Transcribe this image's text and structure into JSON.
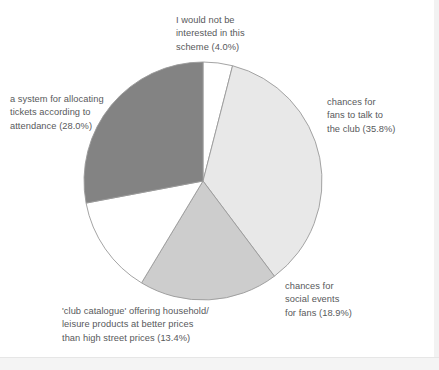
{
  "figure": {
    "background_color": "#ffffff",
    "text_color": "#58595b",
    "slice_stroke_color": "#9a9a9a"
  },
  "chart_data": {
    "type": "pie",
    "title": "",
    "subtitle": "",
    "xlabel": "",
    "ylabel": "",
    "legend_position": "none",
    "grid": false,
    "start_angle_deg": 0,
    "direction": "clockwise",
    "center": {
      "x": 203,
      "y": 181
    },
    "radius": 119,
    "units": "percent",
    "categories": [
      "I would not be interested in this scheme",
      "chances for fans to talk to the club",
      "chances for social events for fans",
      "'club catalogue' offering household/leisure products at better prices than high street prices",
      "a system for allocating tickets according to attendance"
    ],
    "values": [
      4.0,
      35.8,
      18.9,
      13.4,
      28.0
    ],
    "colors": [
      "#ffffff",
      "#e8e8e8",
      "#cdcdcd",
      "#ffffff",
      "#838383"
    ],
    "slices": [
      {
        "name": "not-interested",
        "label_lines": "I would not be\ninterested in this\nscheme (4.0%)",
        "value": 4.0,
        "value_text": "4.0%",
        "color": "#ffffff",
        "angle_deg": 14.4
      },
      {
        "name": "talk-to-club",
        "label_lines": "chances for\nfans to talk to\nthe club (35.8%)",
        "value": 35.8,
        "value_text": "35.8%",
        "color": "#e8e8e8",
        "angle_deg": 128.9
      },
      {
        "name": "social-events",
        "label_lines": "chances for\nsocial events\nfor fans (18.9%)",
        "value": 18.9,
        "value_text": "18.9%",
        "color": "#cdcdcd",
        "angle_deg": 68.0
      },
      {
        "name": "club-catalogue",
        "label_lines": "'club catalogue' offering household/\nleisure products at better prices\nthan high street prices (13.4%)",
        "value": 13.4,
        "value_text": "13.4%",
        "color": "#ffffff",
        "angle_deg": 48.2
      },
      {
        "name": "allocating-tickets",
        "label_lines": "a system for allocating\ntickets according to\nattendance (28.0%)",
        "value": 28.0,
        "value_text": "28.0%",
        "color": "#838383",
        "angle_deg": 100.8
      }
    ]
  }
}
